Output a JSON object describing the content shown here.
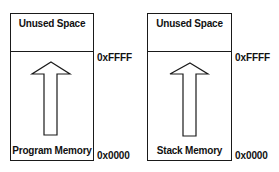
{
  "diagrams": [
    {
      "top_label": "Unused Space",
      "bottom_label": "Program Memory",
      "high_address": "0xFFFF",
      "low_address": "0x0000",
      "arrow": "up-arrow"
    },
    {
      "top_label": "Unused Space",
      "bottom_label": "Stack Memory",
      "high_address": "0xFFFF",
      "low_address": "0x0000",
      "arrow": "up-arrow"
    }
  ],
  "colors": {
    "stroke": "#1a1a1a",
    "background": "#ffffff"
  }
}
